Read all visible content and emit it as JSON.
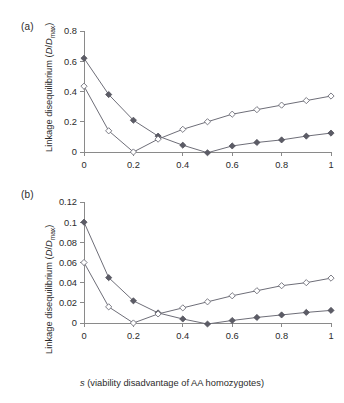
{
  "figure": {
    "panels": [
      {
        "id": "a",
        "label": "(a)",
        "ylabel_prefix": "Linkage disequilibrium (",
        "ylabel_d1": "D",
        "ylabel_slash": "/",
        "ylabel_d2": "D",
        "ylabel_sub": "max",
        "ylabel_suffix": ")"
      },
      {
        "id": "b",
        "label": "(b)",
        "ylabel_prefix": "Linkage disequilibrium (",
        "ylabel_d1": "D",
        "ylabel_slash": "/",
        "ylabel_d2": "D",
        "ylabel_sub": "max",
        "ylabel_suffix": ")",
        "xlabel_italic": "s",
        "xlabel_rest": " (viability disadvantage of AA homozygotes)"
      }
    ]
  },
  "chart_data": [
    {
      "type": "line",
      "panel": "a",
      "title": "",
      "xlabel": "s (viability disadvantage of AA homozygotes)",
      "ylabel": "Linkage disequilibrium (D/Dmax)",
      "x": [
        0,
        0.1,
        0.2,
        0.3,
        0.4,
        0.5,
        0.6,
        0.7,
        0.8,
        0.9,
        1.0
      ],
      "xlim": [
        0,
        1
      ],
      "ylim": [
        0,
        0.8
      ],
      "xticks": [
        0,
        0.2,
        0.4,
        0.6,
        0.8,
        1
      ],
      "xticklabels": [
        "0",
        "0.2",
        "0.4",
        "0.6",
        "0.8",
        "1"
      ],
      "yticks": [
        0,
        0.2,
        0.4,
        0.6,
        0.8
      ],
      "yticklabels": [
        "0",
        "0.2",
        "0.4",
        "0.6",
        "0.8"
      ],
      "grid": false,
      "legend": "none",
      "series": [
        {
          "name": "filled-diamond-series",
          "marker": "filled-diamond",
          "values": [
            0.62,
            0.38,
            0.21,
            0.105,
            0.045,
            -0.005,
            0.04,
            0.063,
            0.08,
            0.105,
            0.125
          ]
        },
        {
          "name": "open-diamond-series",
          "marker": "open-diamond",
          "values": [
            0.435,
            0.14,
            0.0,
            0.085,
            0.15,
            0.2,
            0.25,
            0.28,
            0.31,
            0.34,
            0.37
          ]
        }
      ]
    },
    {
      "type": "line",
      "panel": "b",
      "title": "",
      "xlabel": "s (viability disadvantage of AA homozygotes)",
      "ylabel": "Linkage disequilibrium (D/Dmax)",
      "x": [
        0,
        0.1,
        0.2,
        0.3,
        0.4,
        0.5,
        0.6,
        0.7,
        0.8,
        0.9,
        1.0
      ],
      "xlim": [
        0,
        1
      ],
      "ylim": [
        0,
        0.12
      ],
      "xticks": [
        0,
        0.2,
        0.4,
        0.6,
        0.8,
        1
      ],
      "xticklabels": [
        "0",
        "0.2",
        "0.4",
        "0.6",
        "0.8",
        "1"
      ],
      "yticks": [
        0,
        0.02,
        0.04,
        0.06,
        0.08,
        0.1,
        0.12
      ],
      "yticklabels": [
        "0",
        "0.02",
        "0.04",
        "0.06",
        "0.08",
        "0.1",
        "0.12"
      ],
      "grid": false,
      "legend": "none",
      "series": [
        {
          "name": "filled-diamond-series",
          "marker": "filled-diamond",
          "values": [
            0.1,
            0.045,
            0.022,
            0.01,
            0.004,
            -0.001,
            0.0025,
            0.0055,
            0.008,
            0.0105,
            0.0125
          ]
        },
        {
          "name": "open-diamond-series",
          "marker": "open-diamond",
          "values": [
            0.06,
            0.016,
            0.0,
            0.009,
            0.015,
            0.021,
            0.027,
            0.032,
            0.037,
            0.04,
            0.0445
          ]
        }
      ]
    }
  ],
  "colors": {
    "axis": "#8a8a8a",
    "line": "#6e6e78",
    "marker_fill": "#5c5c66",
    "marker_open_fill": "#ffffff",
    "text": "#2b2b2b",
    "background": "#ffffff"
  }
}
